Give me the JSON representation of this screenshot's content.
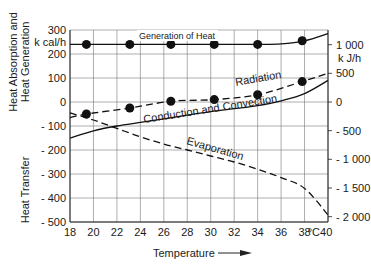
{
  "chart_data": {
    "type": "line",
    "title": "",
    "xlabel": "Temperature",
    "x_unit": "°C",
    "ylabel_left_top": "Heat Absorption and Heat Generation",
    "ylabel_left_bottom": "Heat Transfer",
    "ylabel_left_unit": "k cal/h",
    "ylabel_right_unit": "k J/h",
    "xlim": [
      18,
      40
    ],
    "ylim": [
      -500,
      300
    ],
    "x_ticks": [
      "18",
      "20",
      "22",
      "24",
      "26",
      "28",
      "30",
      "32",
      "34",
      "36",
      "38",
      "°C40"
    ],
    "y_ticks_left": [
      "300",
      "200",
      "100",
      "0",
      "- 100",
      "- 200",
      "- 300",
      "- 400",
      "- 500"
    ],
    "y_ticks_right": [
      "1 000",
      "500",
      "0",
      "- 500",
      "- 1 000",
      "- 1 500",
      "- 2 000"
    ],
    "grid": true,
    "series": [
      {
        "name": "Generation of Heat",
        "style": "solid",
        "markers": true,
        "x": [
          18,
          19,
          20,
          22,
          24,
          26,
          28,
          30,
          32,
          34,
          36,
          38,
          40
        ],
        "values": [
          240,
          240,
          240,
          240,
          240,
          240,
          240,
          240,
          240,
          240,
          242,
          255,
          285
        ],
        "marker_points": [
          [
            19.4,
            240
          ],
          [
            23.1,
            240
          ],
          [
            26.6,
            240
          ],
          [
            30.3,
            240
          ],
          [
            34,
            240
          ],
          [
            37.8,
            255
          ]
        ]
      },
      {
        "name": "Radiation",
        "style": "dashed",
        "markers": true,
        "x": [
          18,
          19.4,
          23.1,
          26.6,
          30.3,
          34,
          37.8,
          40
        ],
        "values": [
          -65,
          -50,
          -25,
          3,
          10,
          30,
          85,
          120
        ],
        "marker_points": [
          [
            19.4,
            -50
          ],
          [
            23.1,
            -25
          ],
          [
            26.6,
            3
          ],
          [
            30.3,
            10
          ],
          [
            34,
            30
          ],
          [
            37.8,
            85
          ]
        ]
      },
      {
        "name": "Conduction and Convection",
        "style": "solid",
        "markers": false,
        "x": [
          18,
          20,
          22,
          24,
          26,
          28,
          30,
          32,
          34,
          36,
          38,
          40
        ],
        "values": [
          -150,
          -120,
          -100,
          -85,
          -70,
          -55,
          -40,
          -28,
          -15,
          5,
          35,
          90
        ]
      },
      {
        "name": "Evaporation",
        "style": "dashed",
        "markers": false,
        "x": [
          18,
          20,
          22,
          24,
          26,
          28,
          30,
          32,
          34,
          36,
          38,
          40
        ],
        "values": [
          -45,
          -75,
          -110,
          -145,
          -175,
          -200,
          -225,
          -250,
          -280,
          -315,
          -360,
          -470
        ]
      }
    ],
    "annotations": [
      "Generation of Heat",
      "Radiation",
      "Conduction and Convection",
      "Evaporation"
    ]
  }
}
